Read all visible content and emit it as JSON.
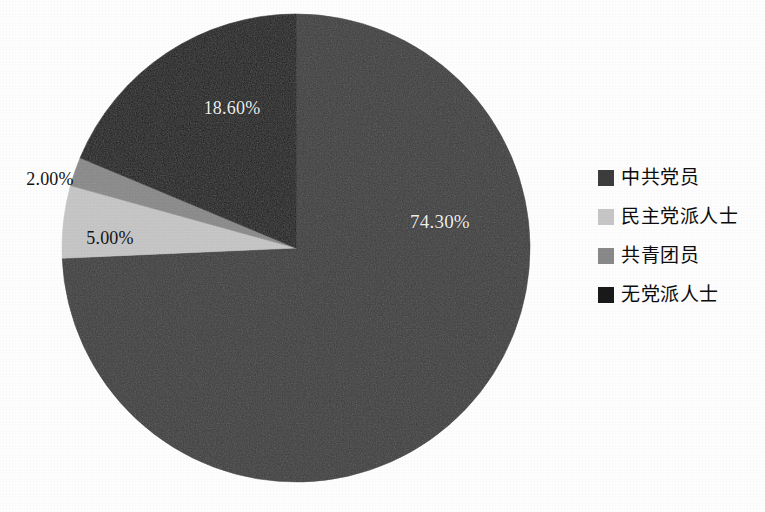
{
  "chart_data": {
    "type": "pie",
    "title": "",
    "subtitle": "",
    "xlabel": "",
    "ylabel": "",
    "grid": false,
    "legend_position": "right",
    "start_angle_deg": 0,
    "direction": "clockwise",
    "categories": [
      "中共党员",
      "民主党派人士",
      "共青团员",
      "无党派人士"
    ],
    "values": [
      74.3,
      5.0,
      2.0,
      18.6
    ],
    "value_labels": [
      "74.30%",
      "5.00%",
      "2.00%",
      "18.60%"
    ],
    "colors": [
      "#3d3d3d",
      "#c8c8c8",
      "#8a8a8a",
      "#1a1a1a"
    ],
    "slices": [
      {
        "name": "中共党员",
        "value": 74.3,
        "label": "74.30%",
        "color": "#3d3d3d",
        "start_deg": 0,
        "end_deg": 267.48,
        "label_color": "#f2f2f2",
        "label_placement": "inside"
      },
      {
        "name": "民主党派人士",
        "value": 5.0,
        "label": "5.00%",
        "color": "#c8c8c8",
        "start_deg": 267.48,
        "end_deg": 285.48,
        "label_color": "#141414",
        "label_placement": "inside"
      },
      {
        "name": "共青团员",
        "value": 2.0,
        "label": "2.00%",
        "color": "#8a8a8a",
        "start_deg": 285.48,
        "end_deg": 292.68,
        "label_color": "#141414",
        "label_placement": "outside"
      },
      {
        "name": "无党派人士",
        "value": 18.6,
        "label": "18.60%",
        "color": "#1a1a1a",
        "start_deg": 292.68,
        "end_deg": 360,
        "label_color": "#f2f2f2",
        "label_placement": "inside"
      }
    ]
  },
  "pie": {
    "center_x": 296,
    "center_y": 248,
    "radius": 234,
    "background": "#ffffff"
  },
  "legend": {
    "items": [
      {
        "label": "中共党员",
        "color": "#3d3d3d"
      },
      {
        "label": "民主党派人士",
        "color": "#c8c8c8"
      },
      {
        "label": "共青团员",
        "color": "#8a8a8a"
      },
      {
        "label": "无党派人士",
        "color": "#1a1a1a"
      }
    ]
  }
}
